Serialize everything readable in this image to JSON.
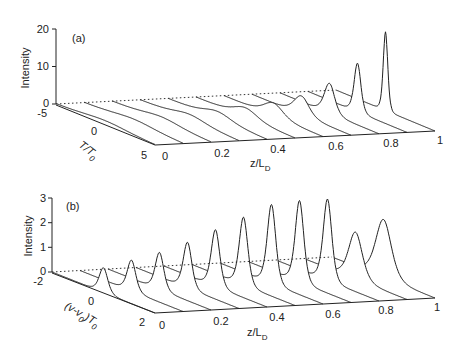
{
  "chart_data": [
    {
      "type": "line",
      "subtype": "waterfall-3d",
      "panel_label": "(a)",
      "title": "",
      "xlabel": "T/T0",
      "ylabel": "z/L_D",
      "zlabel": "Intensity",
      "x_ticks": [
        "-5",
        "0",
        "5"
      ],
      "y_ticks": [
        "0",
        "0.2",
        "0.4",
        "0.6",
        "0.8",
        "1"
      ],
      "z_ticks": [
        "0",
        "10",
        "20"
      ],
      "xlim": [
        -5,
        5
      ],
      "ylim": [
        0,
        1
      ],
      "zlim": [
        0,
        20
      ],
      "z_positions": [
        0,
        0.1,
        0.2,
        0.3,
        0.4,
        0.5,
        0.6,
        0.7,
        0.8,
        0.9,
        1.0
      ],
      "peak_intensity": [
        1,
        1.1,
        1.3,
        1.6,
        2.0,
        2.6,
        3.5,
        5,
        8,
        13,
        21
      ],
      "peak_width": [
        3.0,
        2.8,
        2.5,
        2.2,
        1.9,
        1.6,
        1.3,
        1.0,
        0.7,
        0.45,
        0.3
      ],
      "peak_center": 0
    },
    {
      "type": "line",
      "subtype": "waterfall-3d",
      "panel_label": "(b)",
      "title": "",
      "xlabel": "(v-v0)T0",
      "ylabel": "z/L_D",
      "zlabel": "Intensity",
      "x_ticks": [
        "-2",
        "0",
        "2"
      ],
      "y_ticks": [
        "0",
        "0.2",
        "0.4",
        "0.6",
        "0.8",
        "1"
      ],
      "z_ticks": [
        "0",
        "1",
        "2",
        "3"
      ],
      "xlim": [
        -2,
        2
      ],
      "ylim": [
        0,
        1
      ],
      "zlim": [
        0,
        3
      ],
      "z_positions": [
        0,
        0.1,
        0.2,
        0.3,
        0.4,
        0.5,
        0.6,
        0.7,
        0.8,
        0.9,
        1.0
      ],
      "peak_intensity": [
        1.0,
        1.25,
        1.5,
        1.85,
        2.3,
        2.75,
        3.2,
        3.3,
        3.3,
        1.9,
        2.35
      ],
      "peak_width": [
        0.22,
        0.22,
        0.22,
        0.22,
        0.22,
        0.22,
        0.22,
        0.22,
        0.22,
        0.35,
        0.4
      ],
      "peak_center": 0
    }
  ],
  "panels": {
    "a": {
      "label": "(a)",
      "zaxis_title": "Intensity",
      "zticks": [
        "0",
        "10",
        "20"
      ],
      "xaxis_title_main": "T/T",
      "xaxis_title_sub": "0",
      "xticks": [
        "-5",
        "0",
        "5"
      ],
      "yaxis_title_main": "z/L",
      "yaxis_title_sub": "D",
      "yticks": [
        "0",
        "0.2",
        "0.4",
        "0.6",
        "0.8",
        "1"
      ]
    },
    "b": {
      "label": "(b)",
      "zaxis_title": "Intensity",
      "zticks": [
        "0",
        "1",
        "2",
        "3"
      ],
      "xaxis_title_main": "(v-v",
      "xaxis_title_sub": "0",
      "xaxis_title_tail": ")T",
      "xaxis_title_sub2": "0",
      "xticks": [
        "-2",
        "0",
        "2"
      ],
      "yaxis_title_main": "z/L",
      "yaxis_title_sub": "D",
      "yticks": [
        "0",
        "0.2",
        "0.4",
        "0.6",
        "0.8",
        "1"
      ]
    }
  }
}
